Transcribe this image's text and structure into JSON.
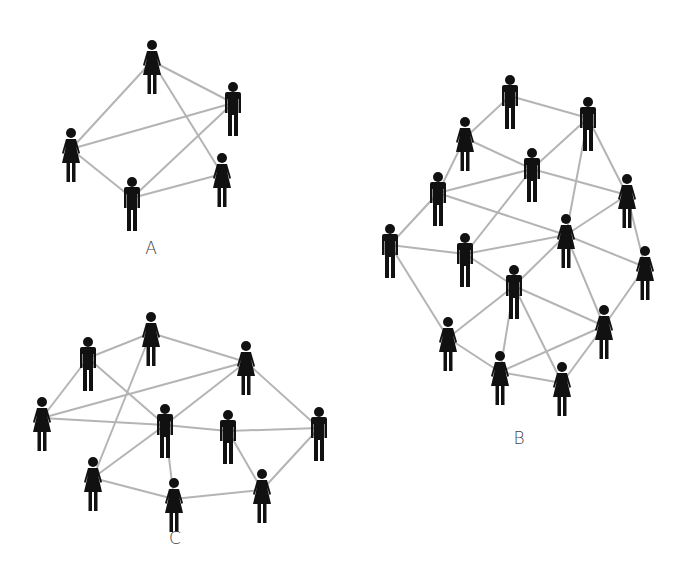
{
  "diagram": {
    "title": "",
    "colors": {
      "person": "#111111",
      "edge": "#b4b4b4",
      "background": "#ffffff",
      "label": "#444444"
    },
    "networks": [
      {
        "id": "A",
        "label": "A",
        "label_pos": [
          151,
          250
        ],
        "nodes": [
          {
            "id": "a1",
            "type": "female",
            "x": 152,
            "y": 45
          },
          {
            "id": "a2",
            "type": "male",
            "x": 233,
            "y": 87
          },
          {
            "id": "a3",
            "type": "female",
            "x": 71,
            "y": 133
          },
          {
            "id": "a4",
            "type": "male",
            "x": 132,
            "y": 182
          },
          {
            "id": "a5",
            "type": "female",
            "x": 222,
            "y": 158
          }
        ],
        "edges": [
          [
            "a1",
            "a2"
          ],
          [
            "a1",
            "a3"
          ],
          [
            "a1",
            "a5"
          ],
          [
            "a3",
            "a2"
          ],
          [
            "a3",
            "a4"
          ],
          [
            "a4",
            "a2"
          ],
          [
            "a4",
            "a5"
          ]
        ]
      },
      {
        "id": "B",
        "label": "B",
        "label_pos": [
          519,
          440
        ],
        "nodes": [
          {
            "id": "b1",
            "type": "male",
            "x": 510,
            "y": 80
          },
          {
            "id": "b2",
            "type": "male",
            "x": 588,
            "y": 102
          },
          {
            "id": "b3",
            "type": "female",
            "x": 465,
            "y": 122
          },
          {
            "id": "b4",
            "type": "male",
            "x": 532,
            "y": 153
          },
          {
            "id": "b5",
            "type": "male",
            "x": 438,
            "y": 177
          },
          {
            "id": "b6",
            "type": "female",
            "x": 627,
            "y": 179
          },
          {
            "id": "b7",
            "type": "male",
            "x": 390,
            "y": 229
          },
          {
            "id": "b8",
            "type": "male",
            "x": 465,
            "y": 238
          },
          {
            "id": "b9",
            "type": "female",
            "x": 566,
            "y": 219
          },
          {
            "id": "b10",
            "type": "female",
            "x": 645,
            "y": 251
          },
          {
            "id": "b11",
            "type": "male",
            "x": 514,
            "y": 270
          },
          {
            "id": "b12",
            "type": "female",
            "x": 448,
            "y": 322
          },
          {
            "id": "b13",
            "type": "female",
            "x": 604,
            "y": 310
          },
          {
            "id": "b14",
            "type": "female",
            "x": 500,
            "y": 356
          },
          {
            "id": "b15",
            "type": "female",
            "x": 562,
            "y": 367
          }
        ],
        "edges": [
          [
            "b1",
            "b2"
          ],
          [
            "b1",
            "b3"
          ],
          [
            "b3",
            "b4"
          ],
          [
            "b3",
            "b5"
          ],
          [
            "b2",
            "b4"
          ],
          [
            "b2",
            "b6"
          ],
          [
            "b2",
            "b9"
          ],
          [
            "b5",
            "b4"
          ],
          [
            "b5",
            "b7"
          ],
          [
            "b5",
            "b9"
          ],
          [
            "b4",
            "b6"
          ],
          [
            "b4",
            "b8"
          ],
          [
            "b7",
            "b8"
          ],
          [
            "b7",
            "b12"
          ],
          [
            "b8",
            "b9"
          ],
          [
            "b8",
            "b11"
          ],
          [
            "b9",
            "b6"
          ],
          [
            "b9",
            "b10"
          ],
          [
            "b9",
            "b11"
          ],
          [
            "b9",
            "b13"
          ],
          [
            "b6",
            "b10"
          ],
          [
            "b10",
            "b13"
          ],
          [
            "b11",
            "b12"
          ],
          [
            "b11",
            "b13"
          ],
          [
            "b11",
            "b14"
          ],
          [
            "b11",
            "b15"
          ],
          [
            "b12",
            "b14"
          ],
          [
            "b13",
            "b14"
          ],
          [
            "b13",
            "b15"
          ],
          [
            "b14",
            "b15"
          ]
        ]
      },
      {
        "id": "C",
        "label": "C",
        "label_pos": [
          175,
          540
        ],
        "nodes": [
          {
            "id": "c1",
            "type": "male",
            "x": 88,
            "y": 342
          },
          {
            "id": "c2",
            "type": "female",
            "x": 151,
            "y": 317
          },
          {
            "id": "c3",
            "type": "female",
            "x": 246,
            "y": 346
          },
          {
            "id": "c4",
            "type": "female",
            "x": 42,
            "y": 402
          },
          {
            "id": "c5",
            "type": "male",
            "x": 165,
            "y": 409
          },
          {
            "id": "c6",
            "type": "male",
            "x": 228,
            "y": 415
          },
          {
            "id": "c7",
            "type": "male",
            "x": 319,
            "y": 412
          },
          {
            "id": "c8",
            "type": "female",
            "x": 93,
            "y": 462
          },
          {
            "id": "c9",
            "type": "female",
            "x": 174,
            "y": 483
          },
          {
            "id": "c10",
            "type": "female",
            "x": 262,
            "y": 474
          }
        ],
        "edges": [
          [
            "c1",
            "c2"
          ],
          [
            "c1",
            "c4"
          ],
          [
            "c1",
            "c5"
          ],
          [
            "c2",
            "c3"
          ],
          [
            "c2",
            "c8"
          ],
          [
            "c4",
            "c3"
          ],
          [
            "c4",
            "c5"
          ],
          [
            "c3",
            "c5"
          ],
          [
            "c3",
            "c7"
          ],
          [
            "c5",
            "c6"
          ],
          [
            "c5",
            "c8"
          ],
          [
            "c5",
            "c9"
          ],
          [
            "c6",
            "c7"
          ],
          [
            "c6",
            "c10"
          ],
          [
            "c7",
            "c10"
          ],
          [
            "c8",
            "c9"
          ],
          [
            "c9",
            "c10"
          ]
        ]
      }
    ]
  }
}
